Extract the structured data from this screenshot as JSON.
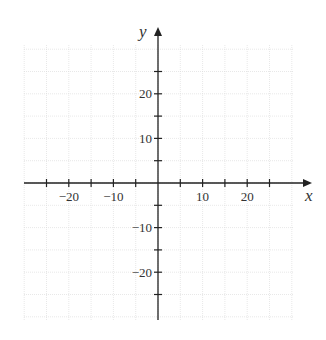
{
  "chart_data": {
    "type": "line",
    "title": "",
    "xlabel": "x",
    "ylabel": "y",
    "xlim": [
      -30,
      30
    ],
    "ylim": [
      -30,
      30
    ],
    "grid": true,
    "grid_step": 5,
    "x_tick_step": 5,
    "y_tick_step": 5,
    "x_tick_labels": [
      "−20",
      "−10",
      "10",
      "20"
    ],
    "x_tick_label_values": [
      -20,
      -10,
      10,
      20
    ],
    "y_tick_labels": [
      "20",
      "10",
      "−10",
      "−20"
    ],
    "y_tick_label_values": [
      20,
      -10,
      10,
      -20
    ],
    "series": []
  },
  "axes": {
    "x_label": "x",
    "y_label": "y"
  },
  "colors": {
    "axis": "#222222",
    "grid": "#d8d8d8",
    "text": "#333333"
  }
}
